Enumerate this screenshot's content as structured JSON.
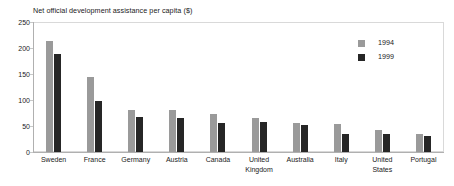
{
  "chart_data": {
    "type": "bar",
    "title": "Net official development assistance per capita ($)",
    "xlabel": "",
    "ylabel": "",
    "ylim": [
      0,
      250
    ],
    "yticks": [
      0,
      50,
      100,
      150,
      200,
      250
    ],
    "grid": false,
    "legend_position": "top-right",
    "categories": [
      "Sweden",
      "France",
      "Germany",
      "Austria",
      "Canada",
      "United Kingdom",
      "Australia",
      "Italy",
      "United States",
      "Portugal"
    ],
    "series": [
      {
        "name": "1994",
        "color": "#9a9a9a",
        "values": [
          213,
          144,
          80,
          80,
          74,
          66,
          55,
          53,
          43,
          35
        ]
      },
      {
        "name": "1999",
        "color": "#262626",
        "values": [
          188,
          98,
          68,
          66,
          55,
          57,
          51,
          34,
          34,
          30
        ]
      }
    ]
  },
  "legend": {
    "items": [
      {
        "label": "1994",
        "color": "#9a9a9a"
      },
      {
        "label": "1999",
        "color": "#262626"
      }
    ]
  },
  "axis": {
    "y_tick_labels": [
      "250",
      "200",
      "150",
      "100",
      "50",
      "0"
    ]
  },
  "x_labels": [
    [
      "Sweden"
    ],
    [
      "France"
    ],
    [
      "Germany"
    ],
    [
      "Austria"
    ],
    [
      "Canada"
    ],
    [
      "United",
      "Kingdom"
    ],
    [
      "Australia"
    ],
    [
      "Italy"
    ],
    [
      "United",
      "States"
    ],
    [
      "Portugal"
    ]
  ],
  "colors": {
    "series_1994": "#9a9a9a",
    "series_1999": "#262626",
    "frame": "#d9d9d9",
    "text": "#1a1a1a",
    "background": "#ffffff"
  }
}
